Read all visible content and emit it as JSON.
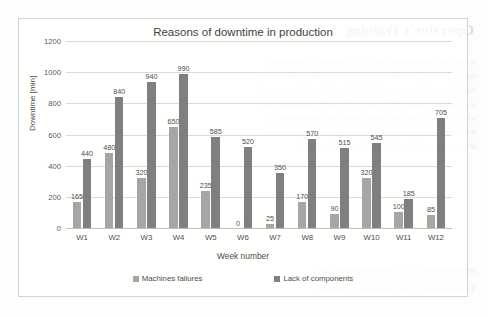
{
  "chart_data": {
    "type": "bar",
    "title": "Reasons of downtime in production",
    "xlabel": "Week number",
    "ylabel": "Downtime [min]",
    "categories": [
      "W1",
      "W2",
      "W3",
      "W4",
      "W5",
      "W6",
      "W7",
      "W8",
      "W9",
      "W10",
      "W11",
      "W12"
    ],
    "series": [
      {
        "name": "Machines failures",
        "color": "#a6a6a6",
        "values": [
          165,
          480,
          320,
          650,
          235,
          0,
          25,
          170,
          90,
          320,
          100,
          85
        ]
      },
      {
        "name": "Lack of components",
        "color": "#7f7f7f",
        "values": [
          440,
          840,
          940,
          990,
          585,
          520,
          350,
          570,
          515,
          545,
          185,
          705
        ]
      }
    ],
    "ylim": [
      0,
      1200
    ],
    "yticks": [
      0,
      200,
      400,
      600,
      800,
      1000,
      1200
    ],
    "ytick_labels": [
      "0",
      "200",
      "400",
      "600",
      "800",
      "1000",
      "1200"
    ],
    "grid": true,
    "data_labels": true,
    "legend_position": "bottom"
  },
  "background_bleed": {
    "heading": "Operator's Training",
    "lines": [
      "in machine maintenance from 2 to 5 persons in production",
      "during a week. 2. Introducing a new set-up time standard with",
      "the data acquisition system. 3. Selection of machine parts and",
      "tools subject to wear. 4. The use of 5S tool in production area",
      "which allowed a run time reduction and an improvement of",
      "the workplace organization and the quality of the processes.",
      "Improvement of material flow between operations.",
      "Implementation of a visual management board.",
      "Standardization of the changeover procedure."
    ]
  }
}
